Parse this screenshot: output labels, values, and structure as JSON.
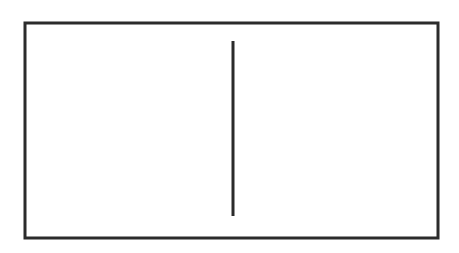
{
  "canvas": {
    "width": 459,
    "height": 253,
    "background_color": "#ffffff",
    "description": "Black and white line drawing: a horizontal rectangle outline divided by a single vertical line"
  },
  "figure": {
    "name": "divided-rectangle",
    "stroke_color": "#2b2b2b",
    "fill_color": "none",
    "shapes": [
      {
        "name": "outer-rectangle",
        "type": "rect",
        "x": 25,
        "y": 23,
        "width": 413,
        "height": 215,
        "stroke_width": 3,
        "stroke_color": "#2b2b2b",
        "fill": "none"
      },
      {
        "name": "vertical-divider-line",
        "type": "line",
        "x1": 233,
        "y1": 41,
        "x2": 233,
        "y2": 216,
        "stroke_width": 3,
        "stroke_color": "#2b2b2b"
      }
    ]
  }
}
